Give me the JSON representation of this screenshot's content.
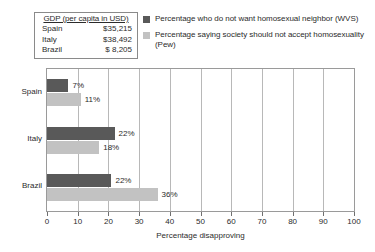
{
  "gdp_table": {
    "header": "GDP (per capita in USD)",
    "rows": [
      {
        "country": "Spain",
        "value": "$35,215"
      },
      {
        "country": "Italy",
        "value": "$38,492"
      },
      {
        "country": "Brazil",
        "value": "$  8,205"
      }
    ]
  },
  "legend": {
    "entries": [
      {
        "label": "Percentage who do not want homosexual neighbor (WVS)",
        "color": "#595959"
      },
      {
        "label": "Percentage saying society should not accept homosexuality (Pew)",
        "color": "#c2c2c2"
      }
    ]
  },
  "chart_data": {
    "type": "bar",
    "orientation": "horizontal",
    "title": "",
    "xlabel": "Percentage disapproving",
    "ylabel": "",
    "xlim": [
      0,
      100
    ],
    "xticks": [
      0,
      10,
      20,
      30,
      40,
      50,
      60,
      70,
      80,
      90,
      100
    ],
    "xtick_labels": [
      "0",
      "10",
      "20",
      "30",
      "40",
      "50",
      "60",
      "70",
      "80",
      "90",
      "100"
    ],
    "grid": "vertical",
    "legend_position": "top-right",
    "categories": [
      "Spain",
      "Italy",
      "Brazil"
    ],
    "series": [
      {
        "name": "Percentage who do not want homosexual neighbor (WVS)",
        "color": "#595959",
        "values": [
          7,
          22,
          22
        ],
        "bar_lengths": [
          7,
          22,
          21
        ],
        "labels": [
          "7%",
          "22%",
          "22%"
        ]
      },
      {
        "name": "Percentage saying society should not accept homosexuality (Pew)",
        "color": "#c2c2c2",
        "values": [
          11,
          18,
          36
        ],
        "bar_lengths": [
          11,
          17,
          36
        ],
        "labels": [
          "11%",
          "18%",
          "36%"
        ]
      }
    ]
  }
}
